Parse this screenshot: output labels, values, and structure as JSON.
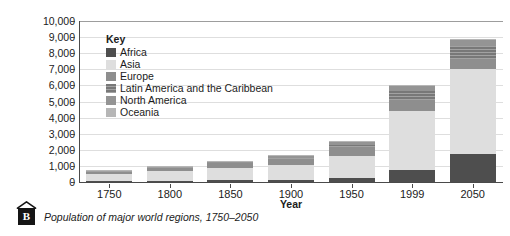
{
  "figure": {
    "badge_letter": "B",
    "caption": "Population of major world regions, 1750–2050"
  },
  "legend": {
    "title": "Key",
    "items": [
      {
        "label": "Africa",
        "color": "#4e4e4e"
      },
      {
        "label": "Asia",
        "color": "#dedede"
      },
      {
        "label": "Europe",
        "color": "#8e8e8e"
      },
      {
        "label": "Latin America and the Caribbean",
        "color": "#7e7e7e"
      },
      {
        "label": "North America",
        "color": "#949494"
      },
      {
        "label": "Oceania",
        "color": "#b6b6b6"
      }
    ]
  },
  "chart_data": {
    "type": "bar",
    "stacked": true,
    "title": "",
    "xlabel": "Year",
    "ylabel": "Population (thousands)",
    "ylim": [
      0,
      10000
    ],
    "ytick_step": 1000,
    "yticks": [
      "10,000",
      "9,000",
      "8,000",
      "7,000",
      "6,000",
      "5,000",
      "4,000",
      "3,000",
      "2,000",
      "1,000",
      "0"
    ],
    "grid": true,
    "legend_position": "inside-top-left",
    "categories": [
      "1750",
      "1800",
      "1850",
      "1900",
      "1950",
      "1999",
      "2050"
    ],
    "series": [
      {
        "name": "Africa",
        "color": "#4e4e4e",
        "values": [
          60,
          90,
          95,
          110,
          220,
          770,
          1770
        ]
      },
      {
        "name": "Asia",
        "color": "#dedede",
        "values": [
          450,
          620,
          800,
          930,
          1380,
          3620,
          5220
        ]
      },
      {
        "name": "Europe",
        "color": "#8e8e8e",
        "values": [
          140,
          190,
          270,
          400,
          550,
          730,
          630
        ]
      },
      {
        "name": "Latin America and the Caribbean",
        "color": "#7e7e7e",
        "values": [
          20,
          30,
          40,
          70,
          170,
          510,
          810
        ]
      },
      {
        "name": "North America",
        "color": "#949494",
        "values": [
          10,
          20,
          30,
          80,
          170,
          310,
          390
        ]
      },
      {
        "name": "Oceania",
        "color": "#b6b6b6",
        "values": [
          10,
          10,
          15,
          20,
          30,
          60,
          80
        ]
      }
    ],
    "totals": [
      690,
      960,
      1250,
      1610,
      2520,
      6000,
      8900
    ]
  }
}
